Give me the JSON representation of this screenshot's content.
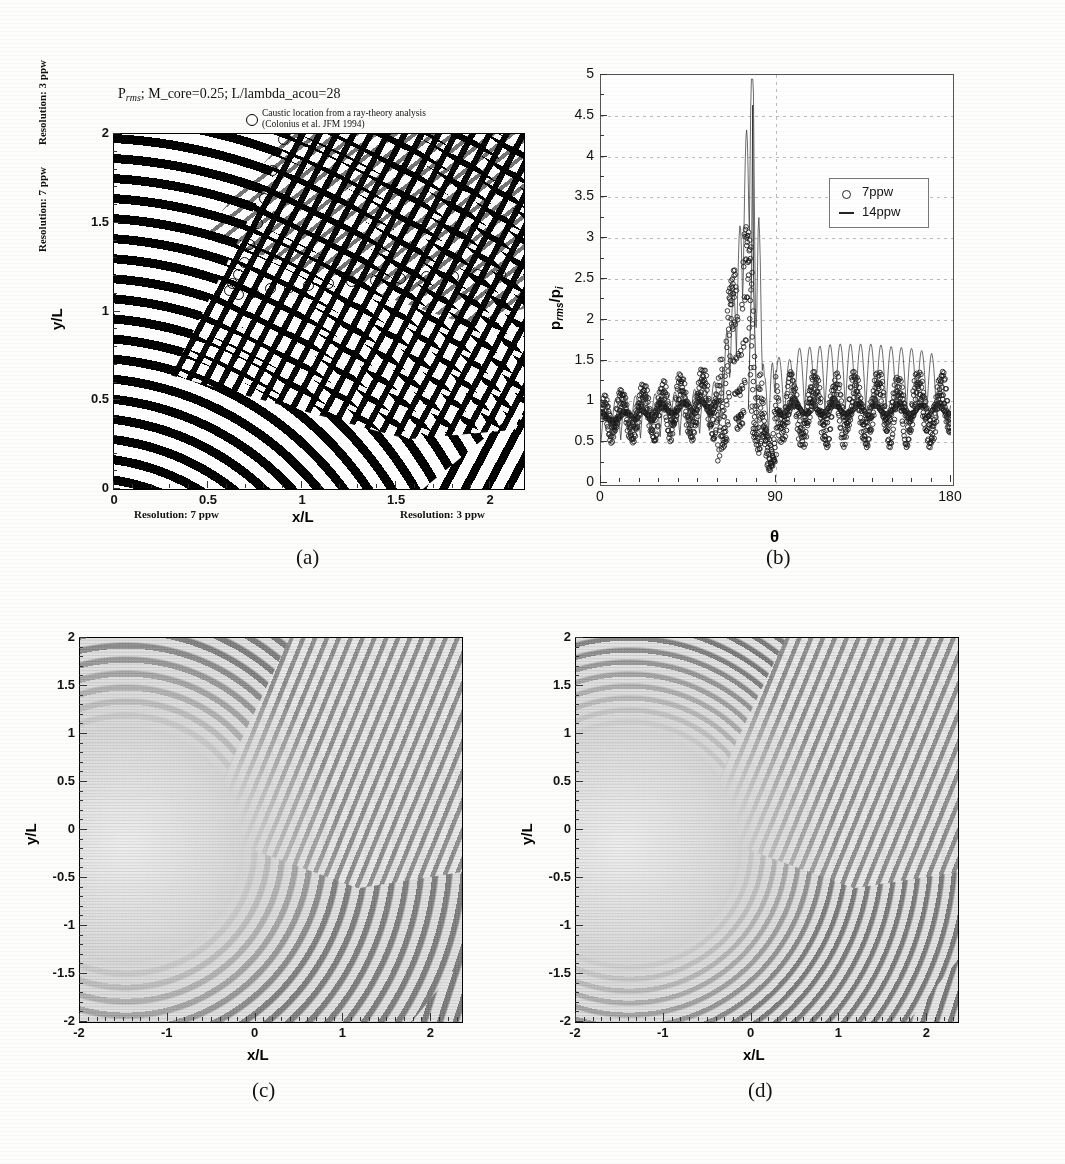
{
  "figure": {
    "kind": "multi-panel-scientific-figure",
    "background_color": "#fdfdfb",
    "ink_color": "#111111",
    "panel_captions": [
      "(a)",
      "(b)",
      "(c)",
      "(d)"
    ]
  },
  "panel_a": {
    "caption": "(a)",
    "title_main": "P",
    "title_sub": "rms",
    "title_rest": "; M_core=0.25; L/lambda_acou=28",
    "legend_note_line1": "Caustic location from a ray-theory analysis",
    "legend_note_line2": "(Colonius et al. JFM 1994)",
    "legend_marker": "circle-marker",
    "xlabel": "x/L",
    "ylabel": "y/L",
    "xticks": [
      "0",
      "0.5",
      "1",
      "1.5",
      "2"
    ],
    "yticks": [
      "0",
      "0.5",
      "1",
      "1.5",
      "2"
    ],
    "note_left_top": "Resolution: 3 ppw",
    "note_left_bottom": "Resolution: 7 ppw",
    "note_bottom_left": "Resolution: 7 ppw",
    "note_bottom_right": "Resolution: 3 ppw"
  },
  "panel_b": {
    "caption": "(b)",
    "xlabel": "θ",
    "ylabel_main": "p",
    "ylabel_sub1": "rms",
    "ylabel_div": "/p",
    "ylabel_sub2": "i",
    "xticks": [
      "0",
      "90",
      "180"
    ],
    "yticks": [
      "0",
      "0.5",
      "1",
      "1.5",
      "2",
      "2.5",
      "3",
      "3.5",
      "4",
      "4.5",
      "5"
    ],
    "legend": [
      {
        "label": "7ppw",
        "marker": "circle-marker"
      },
      {
        "label": "14ppw",
        "marker": "line-marker"
      }
    ]
  },
  "panel_c": {
    "caption": "(c)",
    "xlabel": "x/L",
    "ylabel": "y/L",
    "xticks": [
      "-2",
      "-1",
      "0",
      "1",
      "2"
    ],
    "yticks": [
      "2",
      "1.5",
      "1",
      "0.5",
      "0",
      "-0.5",
      "-1",
      "-1.5",
      "-2"
    ]
  },
  "panel_d": {
    "caption": "(d)",
    "xlabel": "x/L",
    "ylabel": "y/L",
    "xticks": [
      "-2",
      "-1",
      "0",
      "1",
      "2"
    ],
    "yticks": [
      "2",
      "1.5",
      "1",
      "0.5",
      "0",
      "-0.5",
      "-1",
      "-1.5",
      "-2"
    ]
  },
  "chart_data": [
    {
      "id": "panel_a",
      "type": "heatmap",
      "title": "P_rms ; M_core=0.25; L/lambda_acou=28",
      "xlabel": "x/L",
      "ylabel": "y/L",
      "xlim": [
        0,
        2.18
      ],
      "ylim": [
        0,
        2
      ],
      "grid": false,
      "colormap": "binary black/white contour bands",
      "description": "Binary p_rms contour field of an acoustic wave scattered by a vortex; concentric refracted wavefronts at lower-left, plane-wave train lower-right, speckled caustic/shadow region upper-right.",
      "overlay_series": {
        "name": "Caustic location from a ray-theory analysis (Colonius et al. JFM 1994)",
        "marker": "open circle",
        "points": [
          [
            0.9,
            1.97
          ],
          [
            0.84,
            1.8
          ],
          [
            0.8,
            1.64
          ],
          [
            0.76,
            1.5
          ],
          [
            0.72,
            1.38
          ],
          [
            0.69,
            1.28
          ],
          [
            0.66,
            1.21
          ],
          [
            0.63,
            1.16
          ],
          [
            0.61,
            1.12
          ],
          [
            0.66,
            1.1
          ],
          [
            0.74,
            1.11
          ],
          [
            0.83,
            1.13
          ],
          [
            0.93,
            1.14
          ],
          [
            1.03,
            1.15
          ],
          [
            1.14,
            1.16
          ],
          [
            1.26,
            1.17
          ],
          [
            1.39,
            1.18
          ],
          [
            1.52,
            1.19
          ],
          [
            1.66,
            1.2
          ],
          [
            1.8,
            1.2
          ],
          [
            1.93,
            1.21
          ],
          [
            2.05,
            1.21
          ]
        ]
      },
      "annotations": [
        {
          "text": "Resolution: 3 ppw",
          "position": "left-top"
        },
        {
          "text": "Resolution: 7 ppw",
          "position": "left-bottom"
        },
        {
          "text": "Resolution: 7 ppw",
          "position": "bottom-left"
        },
        {
          "text": "Resolution: 3 ppw",
          "position": "bottom-right"
        }
      ]
    },
    {
      "id": "panel_b",
      "type": "line",
      "title": "",
      "xlabel": "θ",
      "ylabel": "p_rms/p_i",
      "xlim": [
        0,
        180
      ],
      "ylim": [
        0,
        5
      ],
      "grid": true,
      "legend_position": "upper-right-inside",
      "series": [
        {
          "name": "7ppw",
          "marker": "open circle",
          "style": "scatter",
          "x": [
            0,
            5,
            10,
            15,
            20,
            25,
            30,
            35,
            40,
            45,
            50,
            55,
            60,
            62,
            64,
            66,
            68,
            70,
            72,
            74,
            76,
            78,
            80,
            82,
            84,
            86,
            88,
            90,
            95,
            100,
            105,
            110,
            115,
            120,
            125,
            130,
            135,
            140,
            145,
            150,
            155,
            160,
            165,
            170,
            175,
            180
          ],
          "y": [
            0.8,
            1.05,
            0.55,
            1.08,
            0.5,
            1.1,
            0.48,
            1.12,
            0.52,
            1.15,
            0.6,
            1.2,
            0.95,
            1.6,
            2.1,
            2.35,
            2.55,
            2.75,
            3.0,
            3.15,
            3.05,
            2.6,
            2.0,
            1.3,
            0.7,
            0.55,
            0.9,
            1.25,
            0.45,
            1.3,
            0.4,
            1.32,
            0.42,
            1.35,
            0.4,
            1.36,
            0.38,
            1.38,
            0.4,
            1.4,
            0.38,
            1.4,
            0.42,
            1.38,
            0.5,
            0.55
          ]
        },
        {
          "name": "14ppw",
          "marker": "solid line",
          "style": "line",
          "x": [
            0,
            10,
            20,
            30,
            40,
            50,
            60,
            66,
            70,
            74,
            76,
            78,
            79,
            80,
            81,
            82,
            84,
            86,
            88,
            90,
            95,
            100,
            110,
            120,
            130,
            140,
            150,
            160,
            170,
            180
          ],
          "y": [
            0.9,
            0.95,
            0.98,
            1.0,
            1.02,
            1.05,
            1.15,
            1.6,
            2.2,
            3.2,
            4.0,
            4.63,
            3.2,
            2.0,
            2.68,
            2.4,
            1.1,
            0.8,
            1.2,
            1.45,
            1.3,
            1.5,
            1.52,
            1.55,
            1.55,
            1.55,
            1.52,
            1.5,
            1.45,
            0.9
          ]
        }
      ],
      "peak": {
        "x": 78,
        "y": 4.63,
        "series": "14ppw"
      }
    },
    {
      "id": "panel_c",
      "type": "heatmap",
      "title": "",
      "xlabel": "x/L",
      "ylabel": "y/L",
      "xlim": [
        -2,
        2.35
      ],
      "ylim": [
        -2,
        2
      ],
      "grid": false,
      "colormap": "grayscale",
      "description": "Grayscale instantaneous pressure field: plane acoustic wave scattered by a vortex centred near the origin, showing wavefront wrapping, a caustic cusp and a speckled shadow region in the upper-right quadrant."
    },
    {
      "id": "panel_d",
      "type": "heatmap",
      "title": "",
      "xlabel": "x/L",
      "ylabel": "y/L",
      "xlim": [
        -2,
        2.35
      ],
      "ylim": [
        -2,
        2
      ],
      "grid": false,
      "colormap": "grayscale",
      "description": "Grayscale instantaneous pressure field at higher resolution; same scattering configuration as panel (c) with sharper caustic structure."
    }
  ]
}
